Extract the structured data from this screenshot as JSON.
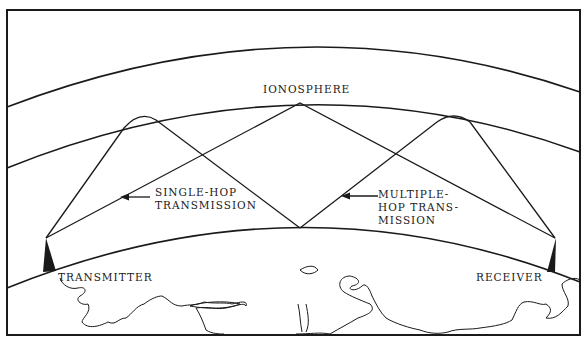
{
  "diagram": {
    "title": "",
    "labels": {
      "ionosphere": "IONOSPHERE",
      "single_hop_line1": "SINGLE-HOP",
      "single_hop_line2": "TRANSMISSION",
      "multi_hop_line1": "MULTIPLE-",
      "multi_hop_line2": "HOP TRANS-",
      "multi_hop_line3": "MISSION",
      "transmitter": "TRANSMITTER",
      "receiver": "RECEIVER"
    },
    "elements": [
      {
        "name": "outer-atmosphere-arc",
        "type": "curve"
      },
      {
        "name": "ionosphere-arc",
        "type": "curve"
      },
      {
        "name": "earth-surface-arc",
        "type": "curve"
      },
      {
        "name": "single-hop-path",
        "from": "transmitter",
        "to": "receiver",
        "hops": 1
      },
      {
        "name": "multiple-hop-path",
        "from": "transmitter",
        "to": "receiver",
        "hops": 2
      },
      {
        "name": "transmitter-antenna",
        "type": "antenna"
      },
      {
        "name": "receiver-antenna",
        "type": "antenna"
      },
      {
        "name": "coastline-outline",
        "type": "map-outline"
      }
    ],
    "colors": {
      "ink": "#1a1a1a",
      "background": "#ffffff"
    }
  }
}
